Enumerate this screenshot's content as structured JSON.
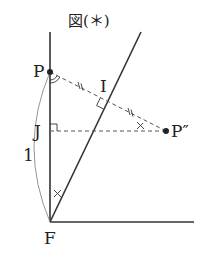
{
  "title": "図(＊)",
  "points": {
    "P": "P",
    "I": "I",
    "J": "J",
    "F": "F",
    "P_double_prime": "P″"
  },
  "length_label": "1",
  "colors": {
    "line": "#333333",
    "dashed": "#555555",
    "background": "#ffffff"
  }
}
